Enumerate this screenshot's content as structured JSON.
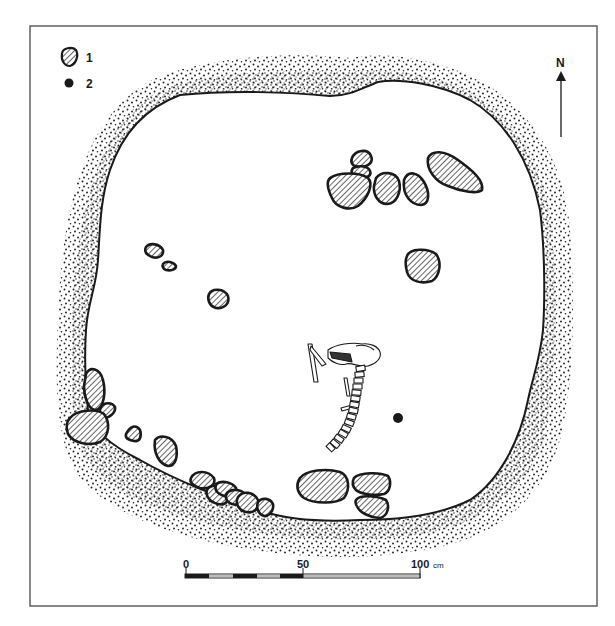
{
  "figure": {
    "type": "archaeological-plan"
  },
  "legend": {
    "items": [
      {
        "symbol": "hatched-stone",
        "label": "1"
      },
      {
        "symbol": "black-dot",
        "label": "2"
      }
    ]
  },
  "north_arrow": {
    "label": "N"
  },
  "scale_bar": {
    "ticks": [
      "0",
      "50",
      "100"
    ],
    "unit": "cm",
    "tick_values_cm": [
      0,
      50,
      100
    ]
  },
  "colors": {
    "ink": "#1a1a1a",
    "hatch": "#333333",
    "paper": "#ffffff",
    "frame": "#555555"
  },
  "features": {
    "stones_count": 27,
    "post_hole_count": 1,
    "skeleton": "animal skeleton (skull, vertebral column, limb bones)"
  }
}
